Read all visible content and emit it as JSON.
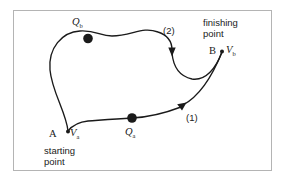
{
  "figure": {
    "background_color": "#ffffff",
    "frame_color": "#b4b4b4",
    "ink_color": "#1a1a1a"
  },
  "labels": {
    "q_upper": "Q",
    "q_upper_sub": "b",
    "q_lower": "Q",
    "q_lower_sub": "a",
    "path_two": "(2)",
    "path_one": "(1)",
    "finishing_point": "finishing\npoint",
    "finishing_point_line1": "finishing",
    "finishing_point_line2": "point",
    "point_b": "B",
    "vb": "V",
    "vb_sub": "b",
    "point_a": "A",
    "va": "V",
    "va_sub": "a",
    "starting_point_line1": "starting",
    "starting_point_line2": "point"
  },
  "diagram_data": {
    "type": "path-diagram",
    "description": "Two curved directed paths from starting point A to finishing point B",
    "nodes": [
      {
        "id": "A",
        "label": "A",
        "role": "starting point",
        "x": 68,
        "y": 131,
        "marker": "small-dot"
      },
      {
        "id": "B",
        "label": "B",
        "role": "finishing point",
        "x": 222,
        "y": 51,
        "marker": "small-dot"
      },
      {
        "id": "Qb",
        "label": "Q",
        "subscript": "b",
        "role": "intermediate point on path 2",
        "x": 88,
        "y": 39,
        "marker": "large-dot"
      },
      {
        "id": "Qa",
        "label": "Q",
        "subscript": "a",
        "role": "intermediate point on path 1",
        "x": 132,
        "y": 118,
        "marker": "large-dot"
      }
    ],
    "paths": [
      {
        "id": "path-1",
        "label": "(1)",
        "from": "A",
        "to": "B",
        "through": [
          "Qa"
        ],
        "arrow_at": {
          "x": 181,
          "y": 106
        },
        "label_position": {
          "x": 186,
          "y": 113
        }
      },
      {
        "id": "path-2",
        "label": "(2)",
        "from": "A",
        "to": "B",
        "through": [
          "Qb"
        ],
        "arrow_at": {
          "x": 172,
          "y": 49
        },
        "label_position": {
          "x": 163,
          "y": 26
        }
      }
    ],
    "velocity_labels": [
      {
        "at": "A",
        "text": "V",
        "subscript": "a"
      },
      {
        "at": "B",
        "text": "V",
        "subscript": "b"
      }
    ]
  }
}
